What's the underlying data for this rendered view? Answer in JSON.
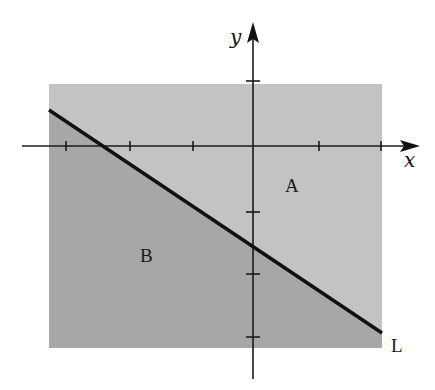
{
  "diagram": {
    "type": "half-plane-regions",
    "axes": {
      "x_label": "x",
      "y_label": "y",
      "origin_px": [
        253,
        146
      ],
      "x_axis": {
        "from_px": 22,
        "to_px": 420,
        "y_px": 146
      },
      "y_axis": {
        "x_px": 253,
        "from_px": 379,
        "to_px": 22
      },
      "x_ticks_px": [
        66,
        130,
        193,
        319,
        381
      ],
      "y_ticks_px": [
        81,
        212,
        274,
        337
      ]
    },
    "rectangle": {
      "x": 49,
      "y": 84,
      "width": 333,
      "height": 264
    },
    "line": {
      "label": "L",
      "from_px": [
        49,
        110
      ],
      "to_px": [
        382,
        333
      ]
    },
    "regions": [
      {
        "label": "A",
        "position_px": [
          292,
          192
        ],
        "shade": "light"
      },
      {
        "label": "B",
        "position_px": [
          147,
          262
        ],
        "shade": "dark"
      }
    ],
    "colors": {
      "region_a": "#c3c3c3",
      "region_b": "#a7a7a7",
      "line": "#111111",
      "axes": "#1a1a1a",
      "background": "#ffffff"
    }
  },
  "labels": {
    "x_axis": "x",
    "y_axis": "y",
    "line": "L",
    "region_a": "A",
    "region_b": "B"
  }
}
